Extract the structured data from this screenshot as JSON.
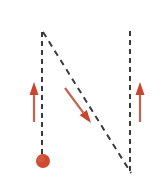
{
  "canvas": {
    "width": 161,
    "height": 188,
    "background": "#ffffff",
    "title": "Vector diagram with dashed guide lines, pendulum bob and three arrows"
  },
  "colors": {
    "dash_line": "#3a3a3a",
    "arrow_shaft": "#c4644f",
    "arrow_head": "#c9452e",
    "bob_fill": "#cf4a2e",
    "bob_highlight": "#d9674a",
    "background": "#ffffff"
  },
  "chart_data": {
    "type": "diagram",
    "title": "",
    "xlabel": "",
    "ylabel": "",
    "grid": false,
    "legend": "none",
    "xlim": [
      0,
      161
    ],
    "ylim": [
      0,
      188
    ],
    "dashed_lines": [
      {
        "name": "left-vertical-guide",
        "x1": 42,
        "y1": 32,
        "x2": 42,
        "y2": 156,
        "dash": "5,4",
        "width": 2,
        "color": "#3a3a3a"
      },
      {
        "name": "right-vertical-guide",
        "x1": 130,
        "y1": 31,
        "x2": 130,
        "y2": 174,
        "dash": "5,4",
        "width": 2,
        "color": "#3a3a3a"
      },
      {
        "name": "diagonal-guide",
        "x1": 43,
        "y1": 32,
        "x2": 131,
        "y2": 173,
        "dash": "6,5",
        "width": 2,
        "color": "#3a3a3a"
      }
    ],
    "arrows": [
      {
        "name": "left-up-arrow",
        "direction": "up",
        "x1": 34,
        "y1": 122,
        "x2": 34,
        "y2": 82,
        "length": 40,
        "shaft_width": 2.2,
        "head_width": 9,
        "head_length": 13,
        "color": "#c4644f"
      },
      {
        "name": "middle-diagonal-arrow",
        "direction": "down-right",
        "x1": 65,
        "y1": 88,
        "x2": 91,
        "y2": 123,
        "length": 43,
        "angle_deg": 53,
        "shaft_width": 2.2,
        "head_width": 9,
        "head_length": 13,
        "color": "#c4644f"
      },
      {
        "name": "right-up-arrow",
        "direction": "up",
        "x1": 140,
        "y1": 122,
        "x2": 140,
        "y2": 82,
        "length": 40,
        "shaft_width": 2.2,
        "head_width": 9,
        "head_length": 13,
        "color": "#c4644f"
      }
    ],
    "points": [
      {
        "name": "pendulum-bob",
        "cx": 43,
        "cy": 161,
        "r": 7,
        "fill": "#cf4a2e",
        "shape": "circle"
      }
    ],
    "annotations": []
  }
}
